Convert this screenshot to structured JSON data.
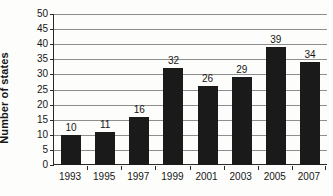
{
  "chart_data": {
    "type": "bar",
    "title": "",
    "xlabel": "",
    "ylabel": "Number of states",
    "categories": [
      "1993",
      "1995",
      "1997",
      "1999",
      "2001",
      "2003",
      "2005",
      "2007"
    ],
    "values": [
      10,
      11,
      16,
      32,
      26,
      29,
      39,
      34
    ],
    "value_labels": [
      "10",
      "11",
      "16",
      "32",
      "26",
      "29",
      "39",
      "34"
    ],
    "ylim": [
      0,
      50
    ],
    "ytick_step": 5,
    "yticks": [
      0,
      5,
      10,
      15,
      20,
      25,
      30,
      35,
      40,
      45,
      50
    ],
    "ytick_labels": [
      "0",
      "5",
      "10",
      "15",
      "20",
      "25",
      "30",
      "35",
      "40",
      "45",
      "50"
    ],
    "grid": "horizontal",
    "legend": "none",
    "series": [
      {
        "name": "Number of states",
        "values": [
          10,
          11,
          16,
          32,
          26,
          29,
          39,
          34
        ]
      }
    ],
    "colors": {
      "bar": "#1a1a1a",
      "gridline": "#8e8e8e",
      "axis": "#2a2a2a",
      "text": "#161616",
      "background": "#fdfdfb"
    }
  }
}
